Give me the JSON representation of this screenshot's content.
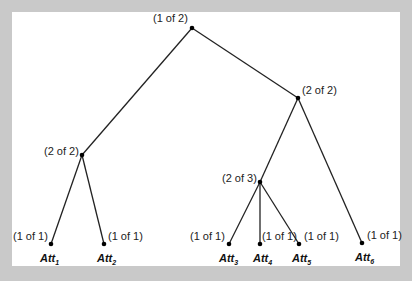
{
  "diagram": {
    "type": "tree",
    "colors": {
      "background": "#c9c9c9",
      "canvas": "#ffffff",
      "edge": "#222222",
      "node": "#000000"
    },
    "nodes": [
      {
        "id": "root",
        "x": 192,
        "y": 28,
        "label": "(1 of 2)",
        "lx": 153,
        "ly": 22
      },
      {
        "id": "right",
        "x": 298,
        "y": 98,
        "label": "(2 of 2)",
        "lx": 302,
        "ly": 94
      },
      {
        "id": "left",
        "x": 82,
        "y": 155,
        "label": "(2 of 2)",
        "lx": 44,
        "ly": 155
      },
      {
        "id": "mid",
        "x": 260,
        "y": 182,
        "label": "(2 of 3)",
        "lx": 222,
        "ly": 182
      },
      {
        "id": "att1",
        "x": 51,
        "y": 244,
        "label": "(1 of 1)",
        "lx": 13,
        "ly": 240,
        "att": "Att",
        "sub": "1",
        "ax": 40
      },
      {
        "id": "att2",
        "x": 104,
        "y": 244,
        "label": "(1 of 1)",
        "lx": 108,
        "ly": 240,
        "att": "Att",
        "sub": "2",
        "ax": 97
      },
      {
        "id": "att3",
        "x": 229,
        "y": 244,
        "label": "(1 of 1)",
        "lx": 190,
        "ly": 240,
        "att": "Att",
        "sub": "3",
        "ax": 219
      },
      {
        "id": "att4",
        "x": 260,
        "y": 244,
        "label": "(1 of 1)",
        "lx": 262,
        "ly": 240,
        "att": "Att",
        "sub": "4",
        "ax": 253
      },
      {
        "id": "att5",
        "x": 299,
        "y": 244,
        "label": "(1 of 1)",
        "lx": 304,
        "ly": 240,
        "att": "Att",
        "sub": "5",
        "ax": 292
      },
      {
        "id": "att6",
        "x": 362,
        "y": 243,
        "label": "(1 of 1)",
        "lx": 367,
        "ly": 239,
        "att": "Att",
        "sub": "6",
        "ax": 355
      }
    ],
    "edges": [
      [
        "root",
        "left"
      ],
      [
        "root",
        "right"
      ],
      [
        "left",
        "att1"
      ],
      [
        "left",
        "att2"
      ],
      [
        "right",
        "mid"
      ],
      [
        "right",
        "att6"
      ],
      [
        "mid",
        "att3"
      ],
      [
        "mid",
        "att4"
      ],
      [
        "mid",
        "att5"
      ]
    ]
  }
}
